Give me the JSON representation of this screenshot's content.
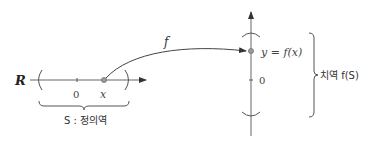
{
  "domain_labels": {
    "set_R": "R",
    "origin_horizontal": "0",
    "point_x": "x",
    "domain": "S : 정의역",
    "function": "f",
    "image_point": "y = f(x)",
    "origin_vertical": "0",
    "range": "치역 f(S)"
  },
  "colors": {
    "axis": "#555555",
    "point": "#888888",
    "text": "#333333"
  }
}
